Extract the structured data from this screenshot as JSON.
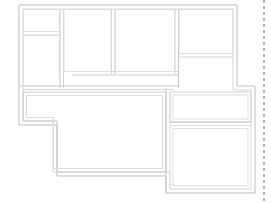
{
  "document": {
    "type": "floor-plan-drawing",
    "title": "",
    "background_color": "#ffffff",
    "wall_color": "#c4c4c4",
    "wall_color_light": "#d8d8d8",
    "sheet_edge_color": "#b0b0b0",
    "canvas": {
      "width": 271,
      "height": 203
    }
  },
  "plan": {
    "name": "residential-floor-plan",
    "label": "",
    "line_weight_outer": 1.0,
    "line_weight_inner": 0.8,
    "wall_thickness": 4,
    "outline_points": "19,5 237,5 237,86 255,86 255,193 166,193 166,176 57,176 57,125 19,125",
    "rooms": [
      {
        "name": "room-upper-left-small",
        "label": "",
        "x": 22,
        "y": 8,
        "w": 38,
        "h": 24
      },
      {
        "name": "room-left-tall",
        "label": "",
        "x": 22,
        "y": 36,
        "w": 38,
        "h": 50
      },
      {
        "name": "room-upper-center",
        "label": "",
        "x": 64,
        "y": 8,
        "w": 48,
        "h": 64
      },
      {
        "name": "room-upper-middle",
        "label": "",
        "x": 116,
        "y": 8,
        "w": 60,
        "h": 64
      },
      {
        "name": "room-upper-right-top",
        "label": "",
        "x": 180,
        "y": 8,
        "w": 54,
        "h": 44
      },
      {
        "name": "room-upper-right-bottom",
        "label": "",
        "x": 180,
        "y": 56,
        "w": 54,
        "h": 26
      },
      {
        "name": "room-lower-left-L",
        "label": "",
        "x": 22,
        "y": 90,
        "w": 140,
        "h": 82
      },
      {
        "name": "room-lower-right-top",
        "label": "",
        "x": 180,
        "y": 90,
        "w": 70,
        "h": 30
      },
      {
        "name": "room-lower-right-bottom",
        "label": "",
        "x": 180,
        "y": 124,
        "w": 70,
        "h": 66
      }
    ],
    "interior_walls": [
      {
        "name": "wall-left-divider-horizontal",
        "x1": 22,
        "y1": 33,
        "x2": 60,
        "y2": 33
      },
      {
        "name": "wall-left-column-vertical",
        "x1": 60,
        "y1": 5,
        "x2": 60,
        "y2": 88
      },
      {
        "name": "wall-center-vertical",
        "x1": 114,
        "y1": 5,
        "x2": 114,
        "y2": 74
      },
      {
        "name": "wall-center-horizontal-stub",
        "x1": 72,
        "y1": 73,
        "x2": 178,
        "y2": 73
      },
      {
        "name": "wall-upper-right-vertical",
        "x1": 178,
        "y1": 5,
        "x2": 178,
        "y2": 86
      },
      {
        "name": "wall-upper-right-horizontal",
        "x1": 178,
        "y1": 55,
        "x2": 237,
        "y2": 55
      },
      {
        "name": "wall-mid-horizontal-left",
        "x1": 19,
        "y1": 88,
        "x2": 120,
        "y2": 88
      },
      {
        "name": "wall-lower-right-vertical",
        "x1": 178,
        "y1": 88,
        "x2": 178,
        "y2": 193
      },
      {
        "name": "wall-lower-right-divider",
        "x1": 178,
        "y1": 122,
        "x2": 255,
        "y2": 122
      },
      {
        "name": "wall-lower-center-vertical",
        "x1": 120,
        "y1": 88,
        "x2": 120,
        "y2": 176
      }
    ]
  },
  "sheet": {
    "name": "sheet-border",
    "dashed_edge_x": 264,
    "dash_pattern": "3 3",
    "label": ""
  }
}
